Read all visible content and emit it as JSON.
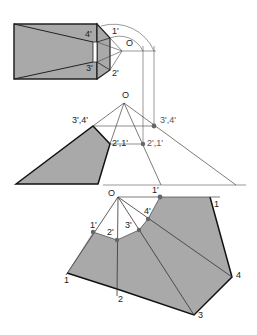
{
  "diagram": {
    "colors": {
      "fill": "#a9a9a9",
      "line": "#222222",
      "thin": "#555555",
      "background": "#ffffff"
    },
    "top_view": {
      "labels": {
        "apex": "O",
        "p1": "1'",
        "p2": "2'",
        "p3": "3'",
        "p4": "4'"
      }
    },
    "front_view": {
      "labels": {
        "apex": "O",
        "left_upper": "3',4'",
        "left_lower": "2',1'",
        "right_upper": "3',4'",
        "right_lower": "2',1'",
        "base_o": "O",
        "base_1": "1'"
      }
    },
    "development": {
      "labels": {
        "apex": "O",
        "t1a": "1'",
        "t2": "2'",
        "t3": "3'",
        "t4": "4'",
        "t1b": "1'",
        "b1a": "1",
        "b2": "2",
        "b3": "3",
        "b4": "4",
        "b1b": "1"
      }
    }
  }
}
